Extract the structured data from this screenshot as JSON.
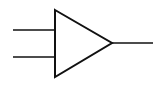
{
  "diagram": {
    "type": "amplifier-symbol",
    "stroke_color": "#111111",
    "background": "#ffffff",
    "triangle": {
      "points": [
        [
          55,
          10
        ],
        [
          112,
          43
        ],
        [
          55,
          77
        ]
      ]
    },
    "inputs": [
      {
        "name": "input-1",
        "x1": 13,
        "y1": 30,
        "x2": 55,
        "y2": 30
      },
      {
        "name": "input-2",
        "x1": 13,
        "y1": 57,
        "x2": 55,
        "y2": 57
      }
    ],
    "output": {
      "name": "output",
      "x1": 112,
      "y1": 43,
      "x2": 153,
      "y2": 43
    }
  }
}
